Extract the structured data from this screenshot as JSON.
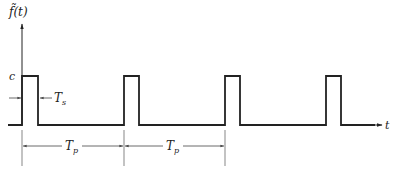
{
  "diagram": {
    "y_axis_label": "f̃(t)",
    "x_axis_label": "t",
    "amplitude_label": "c",
    "pulse_width_label": "Ts",
    "pulse_width_sub": "s",
    "period_label": "T",
    "period_sub": "p",
    "pulses": [
      {
        "x0": 22,
        "x1": 38
      },
      {
        "x0": 124,
        "x1": 139
      },
      {
        "x0": 225,
        "x1": 240
      },
      {
        "x0": 326,
        "x1": 341
      }
    ],
    "colors": {
      "line": "#222222",
      "dim": "#555555"
    }
  }
}
